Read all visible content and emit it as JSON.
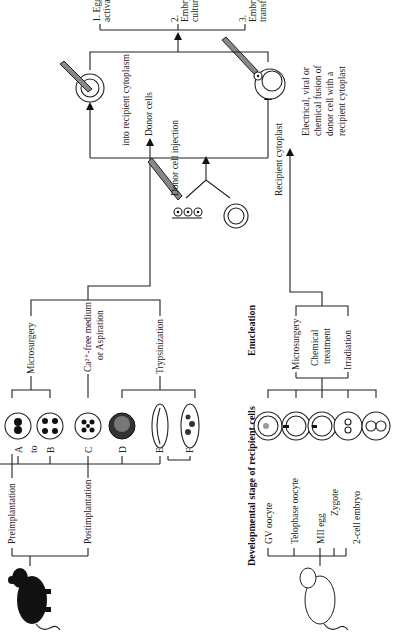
{
  "diagram": {
    "orientation": "rotated 90 degrees counter-clockwise",
    "donor_branch": {
      "source": "black-mouse",
      "groups": [
        {
          "label": "Preimplantation",
          "stages": [
            "A",
            "to",
            "B",
            "C",
            "D",
            "E"
          ]
        },
        {
          "label": "Postimplantation",
          "stages": [
            "E",
            "F"
          ]
        }
      ],
      "methods": [
        {
          "label": "Microsurgery",
          "applies_to": [
            "A",
            "B"
          ]
        },
        {
          "label_line1": "Ca²⁺-free medium",
          "label_line2": "or Aspiration",
          "applies_to": [
            "C"
          ]
        },
        {
          "label": "Trypsinization",
          "applies_to": [
            "D",
            "E",
            "F"
          ]
        }
      ],
      "output": "Donor cells"
    },
    "recipient_branch": {
      "source": "white-mouse",
      "heading": "Developmental stage of recipient cells",
      "stages": [
        "GV oocyte",
        "Telophase oocyte",
        "MII egg",
        "Zygote",
        "2-cell embryo"
      ],
      "enucleation_heading": "Enucleation",
      "enucleation_methods": [
        "Microsurgery",
        "Chemical",
        "treatment",
        "Irradiation"
      ],
      "output": "Recipient cytoplast"
    },
    "transfer": {
      "injection_line1": "Donor cell injection",
      "injection_line2": "into recipient cytoplasm",
      "fusion_lines": [
        "Electrical, viral or",
        "chemical fusion of",
        "donor cell with a",
        "recipient cytoplast"
      ]
    },
    "steps": [
      "1. Egg activation",
      "2. Embryo culture",
      "3. Embryo transfer"
    ]
  }
}
